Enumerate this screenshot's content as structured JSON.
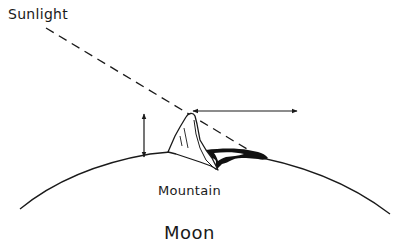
{
  "diagram": {
    "labels": {
      "sunlight": "Sunlight",
      "mountain": "Mountain",
      "moon": "Moon"
    },
    "elements": [
      {
        "id": "sunlight-ray",
        "type": "dashed-line",
        "description": "Incident sunlight ray grazing the mountain peak"
      },
      {
        "id": "moon-surface",
        "type": "arc",
        "description": "Curved lunar surface horizon"
      },
      {
        "id": "mountain",
        "type": "shape",
        "description": "Mountain standing on the lunar surface"
      },
      {
        "id": "shadow",
        "type": "filled-shape",
        "description": "Black shadow cast by mountain on the surface"
      },
      {
        "id": "height-arrow",
        "type": "double-arrow",
        "orientation": "vertical",
        "description": "Mountain height"
      },
      {
        "id": "shadow-length-arrow",
        "type": "double-arrow",
        "orientation": "horizontal",
        "description": "Shadow length"
      }
    ],
    "colors": {
      "background": "#ffffff",
      "ink": "#1a1a1a"
    }
  }
}
